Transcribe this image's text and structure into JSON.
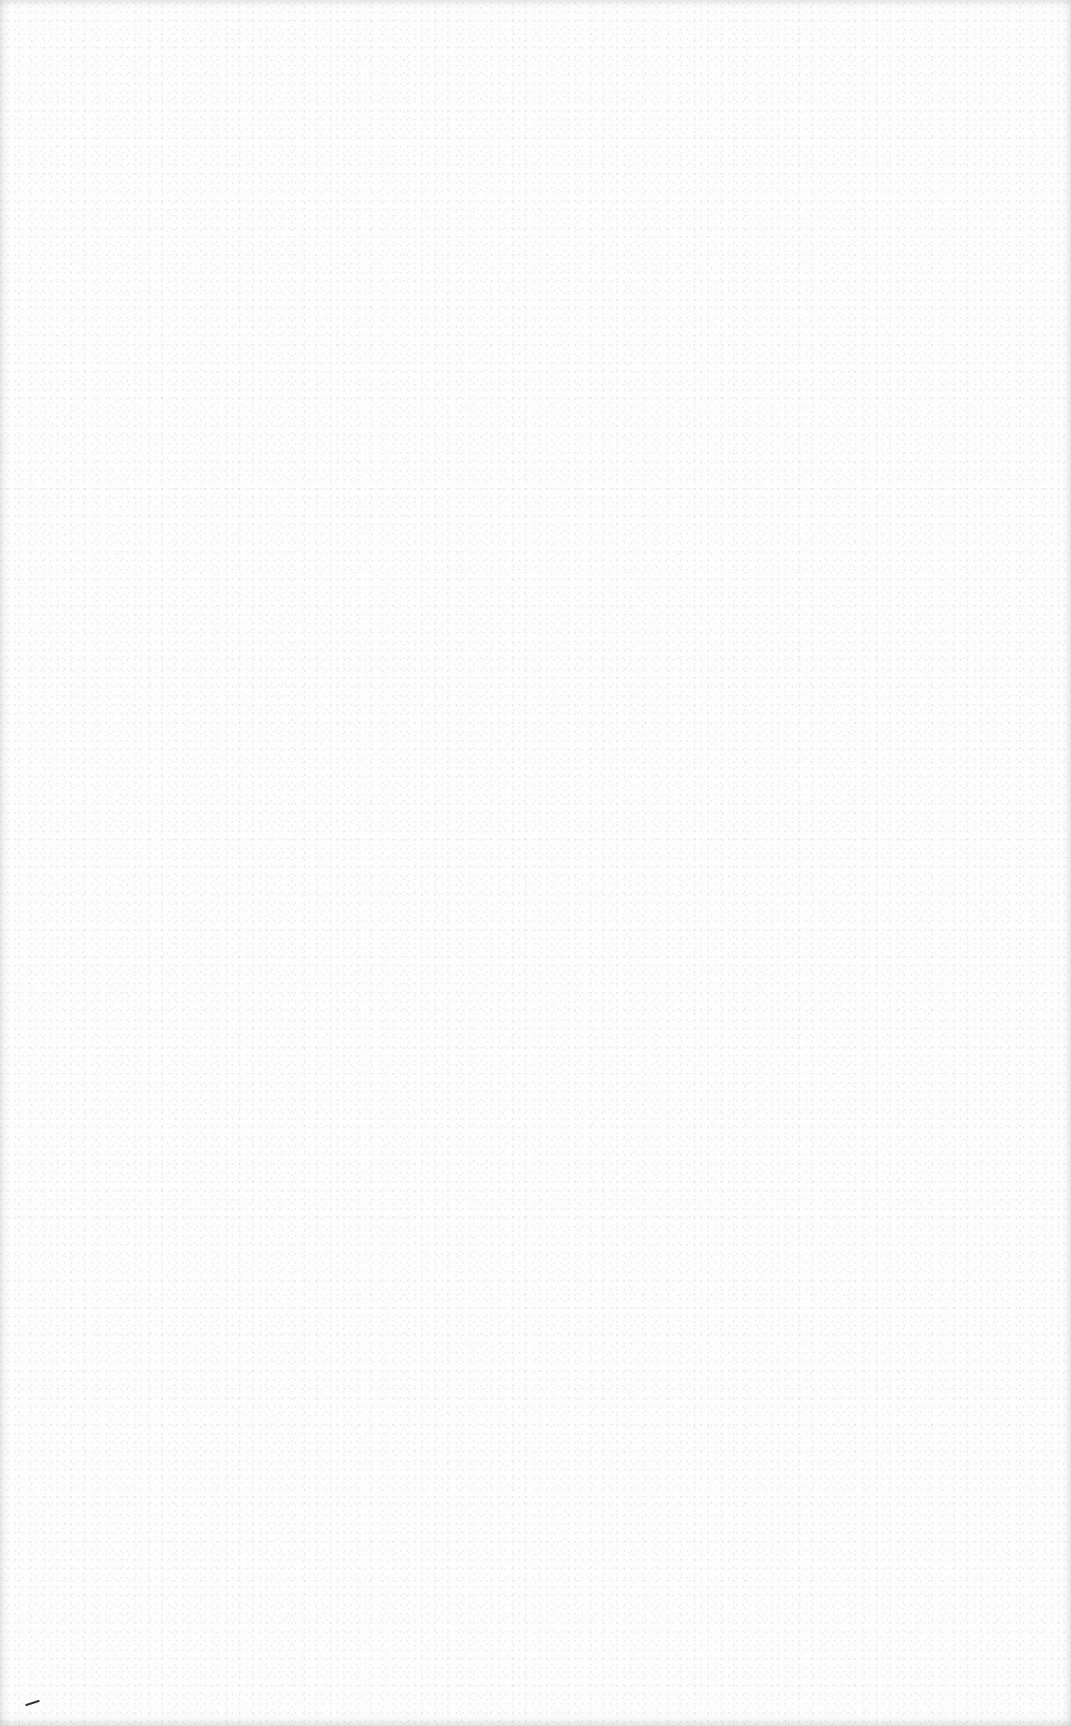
{
  "document": {
    "type": "blank-scanned-page",
    "text_content": "",
    "background_color": "#fdfdfd",
    "stray_mark": {
      "description": "small dark diagonal pen stroke near bottom-left",
      "color": "#333333"
    }
  }
}
